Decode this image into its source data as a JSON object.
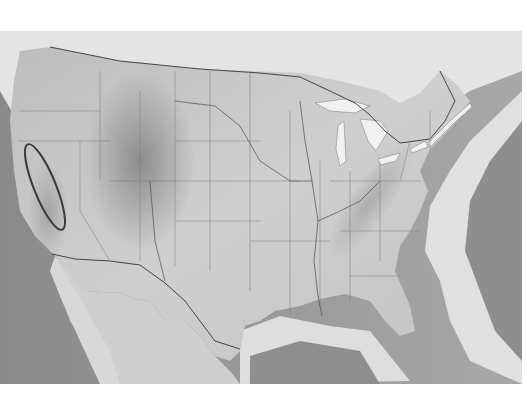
{
  "map": {
    "type": "shaded-relief",
    "region": "contiguous-united-states",
    "colors": {
      "background": "#ffffff",
      "ocean_deep": "#8c8c8c",
      "ocean_shelf": "#e2e2e2",
      "land": "#c9c9c9",
      "land_light": "#dcdcdc",
      "mountains": "#9d9d9d",
      "borders": "#555555",
      "lakes": "#f2f2f2",
      "annotation": "#3a3a3a"
    },
    "annotation": {
      "shape": "ellipse",
      "location": "sierra-nevada-california",
      "center": [
        45,
        187
      ],
      "rx": 11,
      "ry": 46,
      "rotation_deg": -22
    }
  }
}
